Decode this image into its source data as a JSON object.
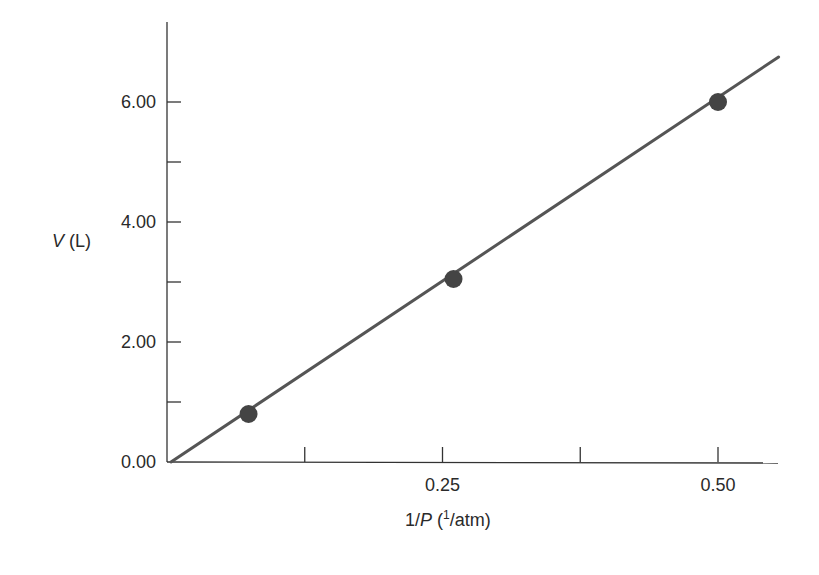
{
  "chart_data": {
    "type": "scatter",
    "title": "",
    "xlabel": "1/P (1/atm)",
    "xlabel_parts": {
      "prefix": "1/",
      "var": "P",
      "space": " (",
      "sup": "1",
      "suffix": "/atm)"
    },
    "ylabel": "V (L)",
    "ylabel_parts": {
      "var": "V",
      "unit": " (L)"
    },
    "xlim": [
      0,
      0.555
    ],
    "ylim": [
      0,
      7.2
    ],
    "x_ticks": [
      {
        "value": 0.125,
        "label": ""
      },
      {
        "value": 0.25,
        "label": "0.25"
      },
      {
        "value": 0.375,
        "label": ""
      },
      {
        "value": 0.5,
        "label": "0.50"
      }
    ],
    "y_ticks": [
      {
        "value": 0.0,
        "label": "0.00"
      },
      {
        "value": 1.0,
        "label": ""
      },
      {
        "value": 2.0,
        "label": "2.00"
      },
      {
        "value": 3.0,
        "label": ""
      },
      {
        "value": 4.0,
        "label": "4.00"
      },
      {
        "value": 5.0,
        "label": ""
      },
      {
        "value": 6.0,
        "label": "6.00"
      }
    ],
    "grid": false,
    "legend": null,
    "series": [
      {
        "name": "data points",
        "type": "scatter",
        "points": [
          {
            "x": 0.074,
            "y": 0.8
          },
          {
            "x": 0.26,
            "y": 3.05
          },
          {
            "x": 0.5,
            "y": 6.0
          }
        ]
      },
      {
        "name": "best-fit line",
        "type": "line",
        "points": [
          {
            "x": 0.0,
            "y": 0.0
          },
          {
            "x": 0.555,
            "y": 6.75
          }
        ]
      }
    ],
    "colors": {
      "axis": "#333333",
      "line": "#555555",
      "marker": "#444444",
      "text": "#2a2a2a"
    }
  }
}
